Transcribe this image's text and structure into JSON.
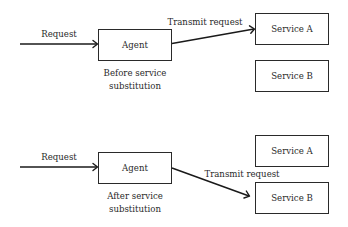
{
  "diagram": {
    "before": {
      "request_label": "Request",
      "agent_label": "Agent",
      "transmit_label": "Transmit request",
      "service_a_label": "Service A",
      "service_b_label": "Service B",
      "caption_line1": "Before service",
      "caption_line2": "substitution",
      "transmit_target": "Service A"
    },
    "after": {
      "request_label": "Request",
      "agent_label": "Agent",
      "transmit_label": "Transmit request",
      "service_a_label": "Service A",
      "service_b_label": "Service B",
      "caption_line1": "After service",
      "caption_line2": "substitution",
      "transmit_target": "Service B"
    }
  }
}
